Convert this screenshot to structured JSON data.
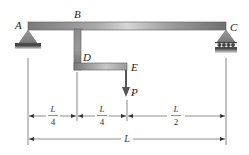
{
  "diagram": {
    "type": "beam-with-bracket",
    "points": {
      "A": "A",
      "B": "B",
      "C": "C",
      "D": "D",
      "E": "E"
    },
    "load": {
      "label": "P",
      "direction": "down"
    },
    "supports": {
      "A": "pin",
      "C": "roller"
    },
    "dimensions": {
      "seg1": {
        "num": "L",
        "den": "4"
      },
      "seg2": {
        "num": "L",
        "den": "4"
      },
      "seg3": {
        "num": "L",
        "den": "2"
      },
      "total": "L"
    },
    "colors": {
      "beam_dark": "#6f6f6f",
      "beam_light": "#d8d8d8",
      "support": "#8a8a8a",
      "ground": "#555555",
      "line": "#444444"
    }
  }
}
